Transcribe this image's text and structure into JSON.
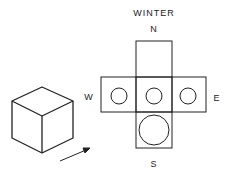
{
  "title": "WINTER",
  "directions": {
    "north": "N",
    "south": "S",
    "east": "E",
    "west": "W"
  },
  "diagram": {
    "type": "cube-net-sun-exposure",
    "faces": [
      {
        "name": "north",
        "sun_circle": "none"
      },
      {
        "name": "west",
        "sun_circle": "small"
      },
      {
        "name": "top",
        "sun_circle": "small"
      },
      {
        "name": "east",
        "sun_circle": "small"
      },
      {
        "name": "south",
        "sun_circle": "large"
      }
    ]
  },
  "colors": {
    "line": "#222222",
    "background": "#ffffff"
  }
}
